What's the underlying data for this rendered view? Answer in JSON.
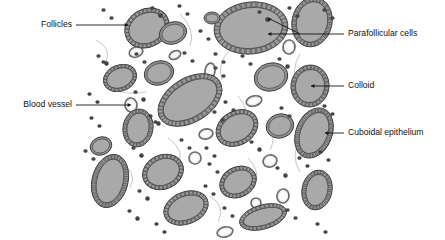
{
  "figure": {
    "background_color": "#ffffff",
    "illustration_bounds": {
      "x": 85,
      "y": 2,
      "width": 247,
      "height": 236
    }
  },
  "palette": {
    "colloid_fill": "#a9a9a9",
    "colloid_stroke": "#5a5a5a",
    "epithelium_fill": "#8f8f8f",
    "epithelium_stroke": "#3d3d3d",
    "parafollicular_fill": "#4a4a4a",
    "vessel_stroke": "#6e6e6e",
    "vessel_fill": "#ffffff",
    "leader_line": "#151515",
    "label_text": "#111111"
  },
  "labels": [
    {
      "id": "follicles",
      "text": "Follicles",
      "side": "left",
      "text_x": 72,
      "text_y": 25,
      "leader": [
        [
          76,
          25
        ],
        [
          128,
          25
        ]
      ],
      "arrow_at": [
        128,
        25
      ],
      "arrow_dir": "right"
    },
    {
      "id": "blood-vessel",
      "text": "Blood vessel",
      "side": "left",
      "text_x": 72,
      "text_y": 105,
      "leader": [
        [
          76,
          105
        ],
        [
          131,
          105
        ]
      ],
      "arrow_at": [
        131,
        105
      ],
      "arrow_dir": "right"
    },
    {
      "id": "parafollicular-cells",
      "text": "Parafollicular cells",
      "side": "right",
      "text_x": 348,
      "text_y": 34,
      "leader": [
        [
          344,
          34
        ],
        [
          268,
          34
        ]
      ],
      "leader2": [
        [
          300,
          34
        ],
        [
          268,
          18
        ]
      ],
      "arrow_at": [
        268,
        34
      ],
      "arrow_dir": "left",
      "arrow2_at": [
        268,
        18
      ],
      "arrow2_dir": "upleft"
    },
    {
      "id": "colloid",
      "text": "Colloid",
      "side": "right",
      "text_x": 348,
      "text_y": 86,
      "leader": [
        [
          344,
          86
        ],
        [
          311,
          86
        ]
      ],
      "arrow_at": [
        311,
        86
      ],
      "arrow_dir": "left"
    },
    {
      "id": "cuboidal-epithelium",
      "text": "Cuboidal epithelium",
      "side": "right",
      "text_x": 348,
      "text_y": 133,
      "leader": [
        [
          344,
          133
        ],
        [
          325,
          133
        ]
      ],
      "arrow_at": [
        325,
        133
      ],
      "arrow_dir": "left"
    }
  ],
  "follicles": [
    {
      "cx": 147,
      "cy": 28,
      "rx": 23,
      "ry": 19,
      "rot": -28,
      "cells": 30,
      "ring": 4.2
    },
    {
      "cx": 251,
      "cy": 28,
      "rx": 37,
      "ry": 26,
      "rot": -6,
      "cells": 40,
      "ring": 5.6
    },
    {
      "cx": 312,
      "cy": 22,
      "rx": 20,
      "ry": 25,
      "rot": 12,
      "cells": 30,
      "ring": 4.6
    },
    {
      "cx": 173,
      "cy": 33,
      "rx": 14,
      "ry": 11,
      "rot": -20,
      "cells": 0,
      "ring": 2.6
    },
    {
      "cx": 212,
      "cy": 18,
      "rx": 8,
      "ry": 6,
      "rot": 0,
      "cells": 0,
      "ring": 2.0
    },
    {
      "cx": 120,
      "cy": 78,
      "rx": 17,
      "ry": 13,
      "rot": -22,
      "cells": 24,
      "ring": 3.4
    },
    {
      "cx": 159,
      "cy": 73,
      "rx": 15,
      "ry": 12,
      "rot": -18,
      "cells": 0,
      "ring": 2.6
    },
    {
      "cx": 190,
      "cy": 100,
      "rx": 35,
      "ry": 22,
      "rot": -32,
      "cells": 40,
      "ring": 5.2
    },
    {
      "cx": 271,
      "cy": 77,
      "rx": 17,
      "ry": 14,
      "rot": -15,
      "cells": 0,
      "ring": 2.8
    },
    {
      "cx": 310,
      "cy": 86,
      "rx": 19,
      "ry": 21,
      "rot": 8,
      "cells": 28,
      "ring": 4.4
    },
    {
      "cx": 138,
      "cy": 128,
      "rx": 15,
      "ry": 19,
      "rot": 10,
      "cells": 24,
      "ring": 4.0
    },
    {
      "cx": 237,
      "cy": 128,
      "rx": 22,
      "ry": 17,
      "rot": -30,
      "cells": 28,
      "ring": 4.2
    },
    {
      "cx": 280,
      "cy": 126,
      "rx": 14,
      "ry": 12,
      "rot": -18,
      "cells": 0,
      "ring": 2.6
    },
    {
      "cx": 314,
      "cy": 133,
      "rx": 18,
      "ry": 26,
      "rot": 22,
      "cells": 32,
      "ring": 4.6
    },
    {
      "cx": 110,
      "cy": 181,
      "rx": 18,
      "ry": 27,
      "rot": 14,
      "cells": 32,
      "ring": 4.8
    },
    {
      "cx": 163,
      "cy": 172,
      "rx": 21,
      "ry": 17,
      "rot": -24,
      "cells": 28,
      "ring": 4.2
    },
    {
      "cx": 186,
      "cy": 208,
      "rx": 23,
      "ry": 16,
      "rot": -22,
      "cells": 30,
      "ring": 4.2
    },
    {
      "cx": 238,
      "cy": 182,
      "rx": 19,
      "ry": 15,
      "rot": -28,
      "cells": 26,
      "ring": 4.0
    },
    {
      "cx": 263,
      "cy": 217,
      "rx": 24,
      "ry": 12,
      "rot": -16,
      "cells": 30,
      "ring": 3.8
    },
    {
      "cx": 317,
      "cy": 190,
      "rx": 15,
      "ry": 20,
      "rot": 12,
      "cells": 26,
      "ring": 4.2
    },
    {
      "cx": 101,
      "cy": 146,
      "rx": 11,
      "ry": 9,
      "rot": -20,
      "cells": 0,
      "ring": 2.2
    }
  ],
  "vessels": [
    {
      "cx": 136,
      "cy": 52,
      "rx": 7,
      "ry": 5,
      "rot": -20
    },
    {
      "cx": 175,
      "cy": 55,
      "rx": 6,
      "ry": 4,
      "rot": -25
    },
    {
      "cx": 289,
      "cy": 47,
      "rx": 6,
      "ry": 7,
      "rot": 5
    },
    {
      "cx": 131,
      "cy": 105,
      "rx": 6,
      "ry": 7,
      "rot": -10
    },
    {
      "cx": 210,
      "cy": 71,
      "rx": 5,
      "ry": 8,
      "rot": 8
    },
    {
      "cx": 254,
      "cy": 101,
      "rx": 8,
      "ry": 5,
      "rot": -15
    },
    {
      "cx": 206,
      "cy": 134,
      "rx": 7,
      "ry": 5,
      "rot": -12
    },
    {
      "cx": 195,
      "cy": 158,
      "rx": 6,
      "ry": 6,
      "rot": 0
    },
    {
      "cx": 270,
      "cy": 161,
      "rx": 7,
      "ry": 6,
      "rot": -18
    },
    {
      "cx": 283,
      "cy": 196,
      "rx": 6,
      "ry": 7,
      "rot": 10
    },
    {
      "cx": 256,
      "cy": 203,
      "rx": 5,
      "ry": 5,
      "rot": 0
    },
    {
      "cx": 225,
      "cy": 232,
      "rx": 8,
      "ry": 5,
      "rot": -14
    }
  ],
  "parafollicular_clusters": [
    {
      "x": 110,
      "y": 14,
      "n": 2
    },
    {
      "x": 159,
      "y": 12,
      "n": 3
    },
    {
      "x": 186,
      "y": 10,
      "n": 2
    },
    {
      "x": 207,
      "y": 35,
      "n": 2
    },
    {
      "x": 266,
      "y": 16,
      "n": 3
    },
    {
      "x": 296,
      "y": 12,
      "n": 2
    },
    {
      "x": 331,
      "y": 14,
      "n": 2
    },
    {
      "x": 105,
      "y": 60,
      "n": 4
    },
    {
      "x": 143,
      "y": 58,
      "n": 2
    },
    {
      "x": 191,
      "y": 57,
      "n": 2
    },
    {
      "x": 222,
      "y": 58,
      "n": 2
    },
    {
      "x": 249,
      "y": 60,
      "n": 2
    },
    {
      "x": 286,
      "y": 63,
      "n": 3
    },
    {
      "x": 96,
      "y": 98,
      "n": 2
    },
    {
      "x": 142,
      "y": 96,
      "n": 3
    },
    {
      "x": 222,
      "y": 72,
      "n": 2
    },
    {
      "x": 232,
      "y": 106,
      "n": 2
    },
    {
      "x": 98,
      "y": 122,
      "n": 2
    },
    {
      "x": 157,
      "y": 120,
      "n": 4
    },
    {
      "x": 221,
      "y": 116,
      "n": 2
    },
    {
      "x": 288,
      "y": 112,
      "n": 2
    },
    {
      "x": 331,
      "y": 110,
      "n": 2
    },
    {
      "x": 188,
      "y": 144,
      "n": 2
    },
    {
      "x": 258,
      "y": 146,
      "n": 3
    },
    {
      "x": 213,
      "y": 152,
      "n": 2
    },
    {
      "x": 92,
      "y": 155,
      "n": 2
    },
    {
      "x": 140,
      "y": 152,
      "n": 3
    },
    {
      "x": 327,
      "y": 156,
      "n": 2
    },
    {
      "x": 146,
      "y": 195,
      "n": 3
    },
    {
      "x": 216,
      "y": 168,
      "n": 2
    },
    {
      "x": 284,
      "y": 172,
      "n": 3
    },
    {
      "x": 136,
      "y": 215,
      "n": 3
    },
    {
      "x": 212,
      "y": 190,
      "n": 2
    },
    {
      "x": 294,
      "y": 214,
      "n": 2
    },
    {
      "x": 231,
      "y": 212,
      "n": 2
    },
    {
      "x": 163,
      "y": 228,
      "n": 2
    },
    {
      "x": 306,
      "y": 162,
      "n": 2
    },
    {
      "x": 324,
      "y": 228,
      "n": 2
    }
  ],
  "stroma_strands": [
    [
      [
        180,
        14
      ],
      [
        196,
        30
      ],
      [
        190,
        46
      ]
    ],
    [
      [
        232,
        48
      ],
      [
        216,
        62
      ],
      [
        222,
        80
      ]
    ],
    [
      [
        108,
        88
      ],
      [
        128,
        96
      ],
      [
        146,
        92
      ]
    ],
    [
      [
        300,
        54
      ],
      [
        290,
        70
      ],
      [
        298,
        86
      ]
    ],
    [
      [
        238,
        96
      ],
      [
        252,
        112
      ],
      [
        244,
        128
      ]
    ],
    [
      [
        168,
        138
      ],
      [
        186,
        150
      ],
      [
        178,
        166
      ]
    ],
    [
      [
        300,
        140
      ],
      [
        290,
        156
      ],
      [
        300,
        172
      ]
    ],
    [
      [
        120,
        162
      ],
      [
        138,
        172
      ],
      [
        130,
        188
      ]
    ],
    [
      [
        248,
        158
      ],
      [
        262,
        172
      ],
      [
        254,
        188
      ]
    ],
    [
      [
        210,
        196
      ],
      [
        226,
        206
      ],
      [
        218,
        222
      ]
    ],
    [
      [
        96,
        40
      ],
      [
        112,
        48
      ],
      [
        106,
        62
      ]
    ],
    [
      [
        266,
        120
      ],
      [
        278,
        136
      ],
      [
        270,
        150
      ]
    ]
  ]
}
